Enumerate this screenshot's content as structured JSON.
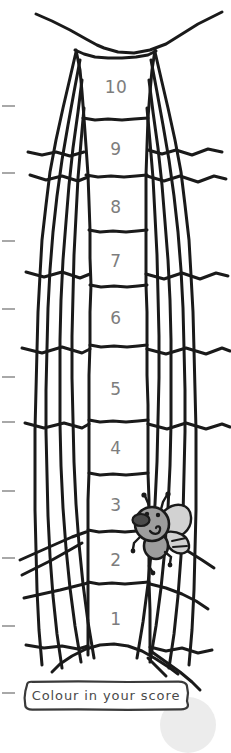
{
  "page": {
    "background_color": "#ffffff",
    "ink_color": "#1a1a1a",
    "number_color": "#7d7d7d",
    "tick_color": "#a8a8a8"
  },
  "ladder": {
    "description": "Vertical column of web cells numbered 10 at top down to 1 at bottom",
    "cells": [
      {
        "label": "10",
        "center_y": 88
      },
      {
        "label": "9",
        "center_y": 150
      },
      {
        "label": "8",
        "center_y": 208
      },
      {
        "label": "7",
        "center_y": 262
      },
      {
        "label": "6",
        "center_y": 319
      },
      {
        "label": "5",
        "center_y": 390
      },
      {
        "label": "4",
        "center_y": 449
      },
      {
        "label": "3",
        "center_y": 506
      },
      {
        "label": "2",
        "center_y": 561
      },
      {
        "label": "1",
        "center_y": 620
      }
    ]
  },
  "margin_ticks": {
    "name": "page-margin-tick-marks",
    "positions_y": [
      105,
      172,
      240,
      308,
      376,
      421,
      490,
      557,
      625,
      692
    ]
  },
  "fly": {
    "name": "cartoon-fly",
    "description": "Cartoon fly caught in the web beside cells 3 and 2",
    "x": 128,
    "y": 497,
    "body_color": "#9d9d9d",
    "wing_color": "#cfcfcf",
    "outline_color": "#1a1a1a",
    "snout_color": "#4a4a4a"
  },
  "score_box": {
    "label": "Colour in your score",
    "border_color": "#3a3a3a",
    "text_color": "#4a4a4a"
  },
  "smudge": {
    "name": "page-smudge",
    "color": "#ececec"
  }
}
